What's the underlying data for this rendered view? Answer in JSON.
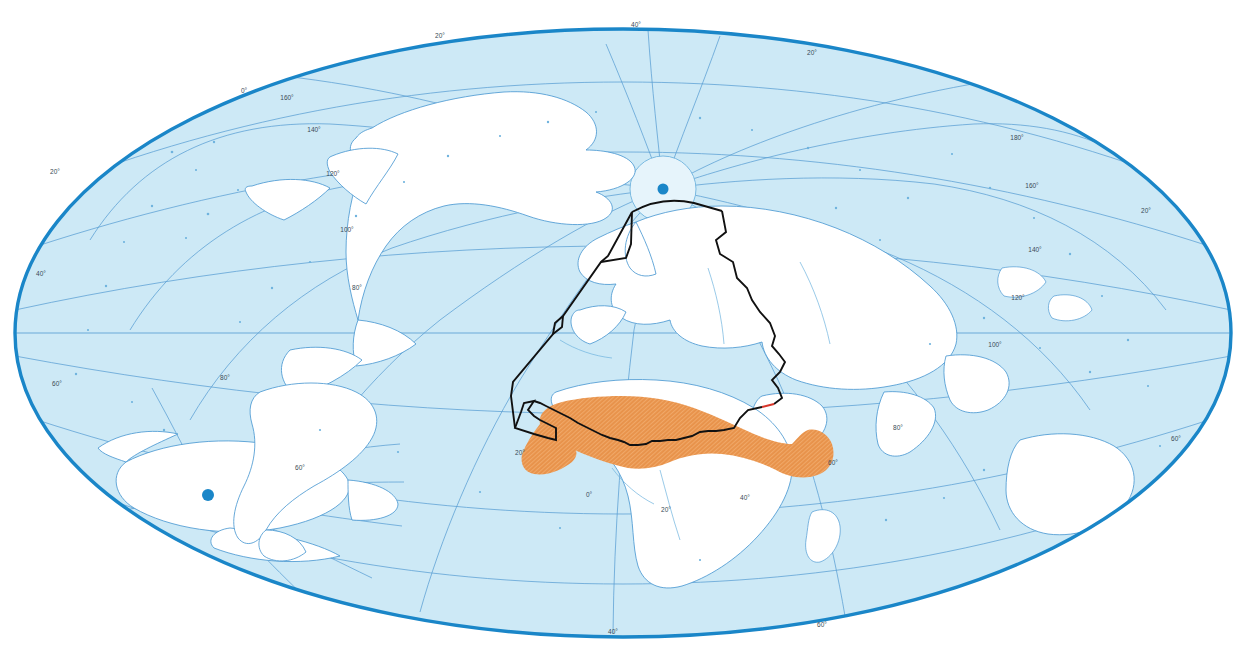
{
  "map": {
    "title": "World map, Hammer-Aitoff projection",
    "projection": "hammer-aitoff",
    "center_lon": 60,
    "ocean_color": "#cde9f6",
    "land_color": "#ffffff",
    "graticule_color": "#5b9fd4",
    "frame_color": "#1a86c8",
    "coast_color": "#4d9ad2",
    "boundary_color": "#111111",
    "boundary_accent_color": "#d8352a",
    "highlight_color": "#e8924a",
    "graticule_step_deg": 20,
    "frame": {
      "cx": 623,
      "cy": 333,
      "rx": 614,
      "ry": 310
    },
    "poles": [
      {
        "name": "north-pole",
        "x": 663,
        "y": 189,
        "label": "North Pole"
      },
      {
        "name": "south-pole",
        "x": 208,
        "y": 495,
        "label": "South Pole"
      }
    ],
    "regions": [
      {
        "name": "sahel-band",
        "label": "Sahel",
        "style": "orange hatched band",
        "color": "#e8924a"
      },
      {
        "name": "study-area-boundary",
        "label": "Study area outline",
        "style": "black polyline with red segment",
        "color": "#111111"
      }
    ],
    "graticule_labels": {
      "top": [
        "20°",
        "40°"
      ],
      "left": [
        "0°",
        "20°",
        "40°",
        "60°"
      ],
      "right": [
        "20°",
        "40°",
        "60°"
      ],
      "bottom": [
        "40°",
        "60°"
      ],
      "meridians": [
        "0°",
        "20°",
        "40°",
        "60°",
        "80°",
        "100°",
        "120°",
        "140°",
        "160°",
        "180°"
      ],
      "interior": [
        "0°",
        "20°",
        "40°",
        "60°",
        "80°",
        "100°",
        "120°",
        "140°",
        "160°",
        "180°"
      ]
    },
    "annotations": [
      {
        "id": "lbl-top-20",
        "text": "20°",
        "x": 440,
        "y": 38
      },
      {
        "id": "lbl-top-40",
        "text": "40°",
        "x": 636,
        "y": 27
      },
      {
        "id": "lbl-top-20b",
        "text": "20°",
        "x": 812,
        "y": 55
      },
      {
        "id": "lbl-ul-0",
        "text": "0°",
        "x": 244,
        "y": 93
      },
      {
        "id": "lbl-ul-160",
        "text": "160°",
        "x": 287,
        "y": 100
      },
      {
        "id": "lbl-ul-140",
        "text": "140°",
        "x": 314,
        "y": 132
      },
      {
        "id": "lbl-ul-120",
        "text": "120°",
        "x": 333,
        "y": 176
      },
      {
        "id": "lbl-ul-100",
        "text": "100°",
        "x": 347,
        "y": 232
      },
      {
        "id": "lbl-ul-80",
        "text": "80°",
        "x": 357,
        "y": 290
      },
      {
        "id": "lbl-l-20",
        "text": "20°",
        "x": 55,
        "y": 174
      },
      {
        "id": "lbl-l-40",
        "text": "40°",
        "x": 41,
        "y": 276
      },
      {
        "id": "lbl-l-60",
        "text": "60°",
        "x": 57,
        "y": 386
      },
      {
        "id": "lbl-r-20",
        "text": "20°",
        "x": 1146,
        "y": 213
      },
      {
        "id": "lbl-r-180",
        "text": "180°",
        "x": 1017,
        "y": 140
      },
      {
        "id": "lbl-r-160",
        "text": "160°",
        "x": 1032,
        "y": 188
      },
      {
        "id": "lbl-r-140",
        "text": "140°",
        "x": 1035,
        "y": 252
      },
      {
        "id": "lbl-r-120",
        "text": "120°",
        "x": 1018,
        "y": 300
      },
      {
        "id": "lbl-r-100",
        "text": "100°",
        "x": 995,
        "y": 347
      },
      {
        "id": "lbl-r-60",
        "text": "60°",
        "x": 1176,
        "y": 441
      },
      {
        "id": "lbl-i-0",
        "text": "0°",
        "x": 589,
        "y": 497
      },
      {
        "id": "lbl-i-20",
        "text": "20°",
        "x": 520,
        "y": 455
      },
      {
        "id": "lbl-i-20b",
        "text": "20°",
        "x": 666,
        "y": 512
      },
      {
        "id": "lbl-i-40",
        "text": "40°",
        "x": 745,
        "y": 500
      },
      {
        "id": "lbl-i-60",
        "text": "60°",
        "x": 833,
        "y": 465
      },
      {
        "id": "lbl-i-80",
        "text": "80°",
        "x": 898,
        "y": 430
      },
      {
        "id": "lbl-b-40",
        "text": "40°",
        "x": 613,
        "y": 634
      },
      {
        "id": "lbl-b-60",
        "text": "60°",
        "x": 822,
        "y": 627
      },
      {
        "id": "lbl-ll-60",
        "text": "60°",
        "x": 300,
        "y": 470
      },
      {
        "id": "lbl-ll-80",
        "text": "80°",
        "x": 225,
        "y": 380
      }
    ]
  }
}
